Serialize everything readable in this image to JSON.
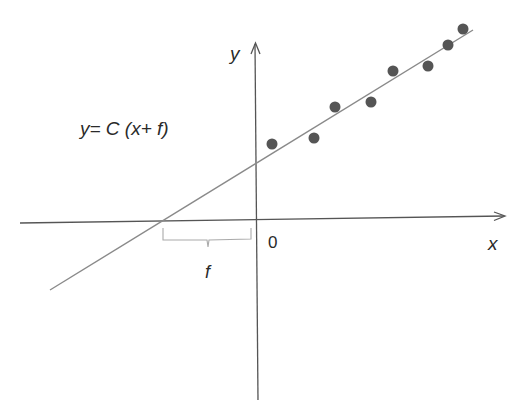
{
  "diagram": {
    "equation": "y= C (x+ f)",
    "axis_labels": {
      "x": "x",
      "y": "y",
      "origin": "0"
    },
    "brace_label": "f",
    "colors": {
      "axis": "#555555",
      "line": "#8a8a8a",
      "dot": "#555555",
      "brace": "#aaaaaa",
      "text": "#2a2a2a"
    },
    "data_points": [
      {
        "x": 272,
        "y": 144
      },
      {
        "x": 314,
        "y": 138
      },
      {
        "x": 335,
        "y": 107
      },
      {
        "x": 371,
        "y": 102
      },
      {
        "x": 393,
        "y": 71
      },
      {
        "x": 428,
        "y": 66
      },
      {
        "x": 448,
        "y": 45
      },
      {
        "x": 463,
        "y": 29
      }
    ]
  }
}
